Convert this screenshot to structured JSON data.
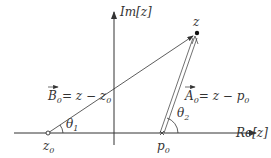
{
  "diagram": {
    "type": "complex-plane-vector-diagram",
    "axes": {
      "x_label": "Re[z]",
      "y_label": "Im[z]"
    },
    "points": {
      "z": {
        "label": "z",
        "x": 197,
        "y": 33,
        "style": "filled"
      },
      "z0": {
        "label": "z",
        "sub": "0",
        "x": 48,
        "y": 133,
        "style": "hollow"
      },
      "p0": {
        "label": "p",
        "sub": "0",
        "x": 162,
        "y": 133,
        "style": "cross"
      }
    },
    "vectors": {
      "B0": {
        "name": "B",
        "sub": "0",
        "expr": "= z − z",
        "expr_sub": "0"
      },
      "A0": {
        "name": "A",
        "sub": "0",
        "expr": "= z − p",
        "expr_sub": "0"
      }
    },
    "angles": {
      "theta1": {
        "label": "θ",
        "sub": "1"
      },
      "theta2": {
        "label": "θ",
        "sub": "2"
      }
    },
    "colors": {
      "stroke": "#333333",
      "background": "#ffffff"
    }
  }
}
